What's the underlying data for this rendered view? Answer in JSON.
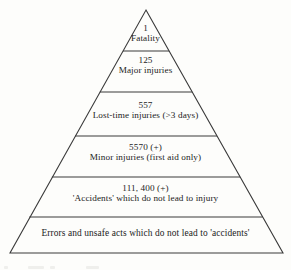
{
  "diagram": {
    "type": "safety-triangle-pyramid",
    "background_color": "#fdfdfb",
    "line_color": "#3a3a3a",
    "text_color": "#1c1c1c",
    "tiers": [
      {
        "level": 1,
        "count": "1",
        "text": "Fatality"
      },
      {
        "level": 2,
        "count": "125",
        "text": "Major injuries"
      },
      {
        "level": 3,
        "count": "557",
        "text": "Lost-time injuries (>3 days)"
      },
      {
        "level": 4,
        "count": "5570 (+)",
        "text": "Minor injuries (first aid only)"
      },
      {
        "level": 5,
        "count": "111, 400 (+)",
        "text": "'Accidents' which do not lead to injury"
      },
      {
        "level": 6,
        "count": "",
        "text": "Errors and unsafe acts which do not lead to 'accidents'"
      }
    ]
  }
}
